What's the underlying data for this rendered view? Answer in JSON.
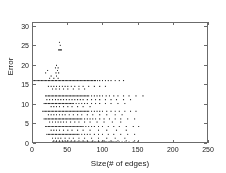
{
  "chart_data": {
    "type": "scatter",
    "title": "",
    "xlabel": "Size(# of edges)",
    "ylabel": "Error",
    "xlim": [
      0,
      250
    ],
    "ylim": [
      0,
      31
    ],
    "xticks": [
      0,
      50,
      100,
      150,
      200,
      250
    ],
    "yticks": [
      0,
      5,
      10,
      15,
      20,
      25,
      30
    ],
    "xtick_labels": [
      "0",
      "50",
      "100",
      "150",
      "200",
      "250"
    ],
    "ytick_labels": [
      "0",
      "5",
      "10",
      "15",
      "20",
      "25",
      "30"
    ],
    "grid": false,
    "legend": null,
    "marker": "dot",
    "marker_color": "#2b2b2b",
    "marker_size": 1.1,
    "axis_color": "#6b6b6b",
    "background": "#ffffff",
    "bands": [
      {
        "error": 26.0,
        "x_points": [
          38
        ]
      },
      {
        "error": 25.2,
        "x_points": [
          39
        ]
      },
      {
        "error": 24.0,
        "x_points": [
          37,
          38,
          39,
          40,
          41
        ]
      },
      {
        "error": 20.0,
        "x_points": [
          34
        ]
      },
      {
        "error": 19.3,
        "x_points": [
          32,
          36
        ]
      },
      {
        "error": 18.6,
        "x_points": [
          21,
          35
        ]
      },
      {
        "error": 18.0,
        "x_points": [
          18,
          33,
          37
        ]
      },
      {
        "error": 17.2,
        "x_points": [
          26,
          34
        ]
      },
      {
        "error": 16.6,
        "x_points": [
          24,
          30,
          36
        ]
      },
      {
        "error": 16.0,
        "x_points": [
          0,
          2,
          4,
          6,
          8,
          10,
          12,
          14,
          16,
          18,
          20,
          22,
          24,
          26,
          28,
          30,
          32,
          34,
          36,
          38,
          40,
          42,
          44,
          46,
          48,
          50,
          52,
          54,
          56,
          58,
          60,
          62,
          64,
          66,
          68,
          70,
          72,
          74,
          76,
          78,
          80,
          82,
          84,
          86,
          88,
          90,
          93,
          96,
          100,
          104,
          108,
          112,
          118,
          124,
          130
        ]
      },
      {
        "error": 14.5,
        "x_points": [
          22,
          26,
          30,
          34,
          38,
          42,
          46,
          50,
          55,
          60,
          66,
          72,
          80,
          88,
          96,
          104
        ]
      },
      {
        "error": 13.8,
        "x_points": [
          28,
          33,
          38,
          44,
          50,
          58,
          66,
          74
        ]
      },
      {
        "error": 12.0,
        "x_points": [
          18,
          20,
          22,
          24,
          26,
          28,
          30,
          32,
          34,
          36,
          38,
          40,
          42,
          44,
          46,
          48,
          50,
          52,
          54,
          56,
          58,
          60,
          62,
          64,
          66,
          68,
          70,
          72,
          74,
          76,
          78,
          80,
          84,
          88,
          92,
          96,
          100,
          105,
          110,
          116,
          122,
          130,
          138,
          148,
          158
        ]
      },
      {
        "error": 11.0,
        "x_points": [
          20,
          24,
          28,
          32,
          36,
          40,
          44,
          48,
          52,
          56,
          60,
          64,
          68,
          72,
          78,
          84,
          90,
          96,
          104,
          112,
          120,
          130,
          140
        ]
      },
      {
        "error": 10.0,
        "x_points": [
          16,
          18,
          20,
          22,
          24,
          26,
          28,
          30,
          32,
          34,
          36,
          38,
          40,
          42,
          44,
          46,
          48,
          50,
          52,
          54,
          56,
          58,
          62,
          66,
          70,
          74,
          78,
          84,
          90,
          96,
          104,
          112,
          122,
          132
        ]
      },
      {
        "error": 9.2,
        "x_points": [
          26,
          30,
          34,
          38,
          44,
          50,
          56,
          64,
          72,
          82
        ]
      },
      {
        "error": 8.0,
        "x_points": [
          14,
          16,
          18,
          20,
          22,
          24,
          26,
          28,
          30,
          32,
          34,
          36,
          38,
          40,
          42,
          44,
          46,
          48,
          50,
          52,
          54,
          56,
          58,
          60,
          62,
          64,
          66,
          68,
          70,
          72,
          74,
          76,
          78,
          80,
          84,
          88,
          92,
          96,
          100,
          106,
          112,
          118,
          124,
          132,
          140,
          148
        ]
      },
      {
        "error": 7.1,
        "x_points": [
          22,
          26,
          30,
          34,
          38,
          42,
          46,
          52,
          58,
          64,
          70,
          78,
          86,
          96,
          106,
          118,
          128
        ]
      },
      {
        "error": 6.0,
        "x_points": [
          16,
          18,
          20,
          22,
          24,
          26,
          28,
          30,
          32,
          34,
          36,
          38,
          40,
          42,
          44,
          46,
          48,
          50,
          52,
          54,
          56,
          58,
          60,
          62,
          64,
          66,
          68,
          70,
          74,
          78,
          82,
          86,
          90,
          96,
          102,
          110,
          118,
          126,
          136,
          146
        ]
      },
      {
        "error": 5.2,
        "x_points": [
          24,
          28,
          32,
          36,
          40,
          44,
          48,
          54,
          60,
          66,
          74,
          82,
          92,
          102,
          114,
          126
        ]
      },
      {
        "error": 4.0,
        "x_points": [
          18,
          20,
          22,
          24,
          26,
          28,
          30,
          32,
          34,
          36,
          38,
          40,
          42,
          44,
          46,
          48,
          50,
          52,
          54,
          56,
          58,
          60,
          62,
          64,
          66,
          68,
          70,
          72,
          76,
          80,
          84,
          88,
          94,
          100,
          108,
          116,
          124,
          134,
          144,
          152
        ]
      },
      {
        "error": 3.1,
        "x_points": [
          26,
          30,
          34,
          38,
          44,
          50,
          56,
          64,
          72,
          82,
          94,
          106,
          120,
          134
        ]
      },
      {
        "error": 2.0,
        "x_points": [
          20,
          22,
          24,
          26,
          28,
          30,
          32,
          34,
          36,
          38,
          40,
          42,
          44,
          46,
          48,
          50,
          52,
          54,
          56,
          58,
          60,
          62,
          64,
          66,
          70,
          74,
          78,
          82,
          88,
          94,
          100,
          108,
          116,
          126,
          136,
          146
        ]
      },
      {
        "error": 1.0,
        "x_points": [
          28,
          32,
          36,
          40,
          46,
          52,
          58,
          66,
          74,
          84,
          94,
          106,
          118,
          132
        ]
      },
      {
        "error": 0.3,
        "x_points": [
          30,
          34,
          38,
          42,
          46,
          50,
          55,
          60,
          66,
          72,
          78,
          86,
          94,
          102,
          112,
          122,
          134,
          146
        ]
      },
      {
        "error": 0.0,
        "x_points": [
          28,
          30,
          32,
          34,
          36,
          38,
          40,
          42,
          44,
          46,
          48,
          50,
          52,
          54,
          56,
          58,
          60,
          62,
          64,
          66,
          68,
          70,
          72,
          74,
          76,
          78,
          80,
          82,
          84,
          86,
          88,
          90,
          92,
          94,
          96,
          98,
          100,
          102,
          104,
          106,
          108,
          110,
          112,
          114,
          116,
          118,
          120,
          124,
          128,
          132,
          138,
          144,
          150
        ]
      }
    ]
  }
}
